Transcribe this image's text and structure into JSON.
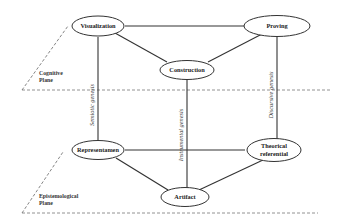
{
  "diagram": {
    "planes": [
      {
        "id": "cognitive",
        "label_line1": "Cognitive",
        "label_line2": "Plane"
      },
      {
        "id": "epistemological",
        "label_line1": "Epistemological",
        "label_line2": "Plane"
      }
    ],
    "nodes": {
      "visualization": {
        "label": "Visualization"
      },
      "proving": {
        "label": "Proving"
      },
      "construction": {
        "label": "Construction"
      },
      "representamen": {
        "label": "Representamen"
      },
      "theorical_referential": {
        "label_line1": "Theorical",
        "label_line2": "referential"
      },
      "artifact": {
        "label": "Artifact"
      }
    },
    "geneses": {
      "semiotic": {
        "label": "Semiotic genesis"
      },
      "instrumental": {
        "label": "Instrumental genesis"
      },
      "discursive": {
        "label": "Discursive genesis"
      }
    },
    "colors": {
      "line": "#333333",
      "dashed": "#666666",
      "background": "#ffffff"
    }
  }
}
